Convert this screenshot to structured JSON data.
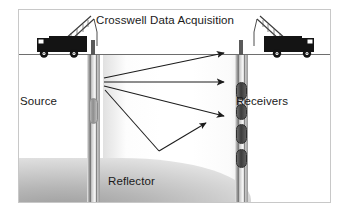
{
  "figure": {
    "title": "Crosswell Data Acquisition",
    "labels": {
      "source": "Source",
      "receivers": "Receivers",
      "reflector": "Reflector"
    },
    "icons": {
      "source_truck": "crane-truck-icon",
      "receiver_truck": "crane-truck-icon-mirrored",
      "source_tool": "source-tool-icon",
      "receiver_tool": "receiver-tool-icon"
    },
    "colors": {
      "frame_border": "#c8c8c8",
      "ground_line": "#6e6e6e",
      "truck_body": "#141414",
      "well_casing": "#8c8c8c",
      "receiver_fill": "#3b3b3b",
      "raypath": "#1c1c1c",
      "reflector_fill": "#b6b6b6",
      "text": "#1a1a1a"
    },
    "wells": {
      "left_well_label": "source-well",
      "right_well_label": "receiver-well",
      "receiver_count": 4
    },
    "raypaths": [
      {
        "name": "direct-ray-upper",
        "x1": 103,
        "y1": 113,
        "x2": 223,
        "y2": 88
      },
      {
        "name": "direct-ray-middle",
        "x1": 103,
        "y1": 117,
        "x2": 223,
        "y2": 117
      },
      {
        "name": "direct-ray-lower",
        "x1": 103,
        "y1": 121,
        "x2": 223,
        "y2": 151
      },
      {
        "name": "reflected-ray-down",
        "x1": 104,
        "y1": 125,
        "x2": 158,
        "y2": 186
      },
      {
        "name": "reflected-ray-up",
        "x1": 158,
        "y1": 186,
        "x2": 205,
        "y2": 158
      }
    ]
  }
}
